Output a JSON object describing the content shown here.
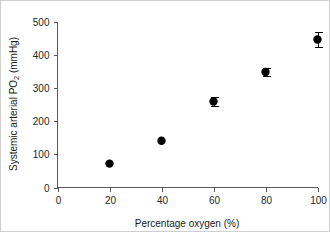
{
  "chart_data": {
    "type": "scatter",
    "title": "",
    "xlabel": "Percentage oxygen (%)",
    "ylabel_main": "Systemic arterial PO",
    "ylabel_sub": "2",
    "ylabel_tail": " (mmHg)",
    "ylabel_full": "Systemic arterial PO2 (mmHg)",
    "x": [
      20,
      40,
      60,
      80,
      100
    ],
    "values": [
      72,
      141,
      259,
      348,
      446
    ],
    "errors": [
      0,
      0,
      14,
      11,
      23
    ],
    "xlim": [
      0,
      100
    ],
    "ylim": [
      0,
      500
    ],
    "xticks": [
      0,
      20,
      40,
      60,
      80,
      100
    ],
    "yticks": [
      0,
      100,
      200,
      300,
      400,
      500
    ],
    "xtick_labels": [
      "0",
      "20",
      "40",
      "60",
      "80",
      "100"
    ],
    "ytick_labels": [
      "0",
      "100",
      "200",
      "300",
      "400",
      "500"
    ],
    "grid": false,
    "legend": "none",
    "marker": "filled-circle",
    "marker_color": "#000000",
    "axis_color": "#595959",
    "background": "#ffffff",
    "border_color": "#cfcfcf",
    "spines": [
      "left",
      "bottom"
    ],
    "tick_direction": "out"
  }
}
